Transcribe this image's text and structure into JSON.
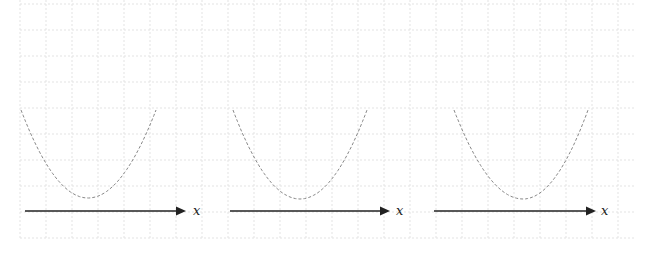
{
  "diagram": {
    "background": "#ffffff",
    "grid": {
      "x_start": 20,
      "x_end": 635,
      "y_start": 0,
      "y_end": 238,
      "spacing": 26,
      "color": "#e3e3e3",
      "dash": "2,2"
    },
    "curve_color": "#888888",
    "axis_color": "#222222",
    "panels": [
      {
        "name": "panel-1",
        "curve": {
          "x_left": 21,
          "x_right": 156,
          "x_min": 88,
          "y_top": 110,
          "y_min": 198
        },
        "axis": {
          "x_start": 25,
          "x_end": 186,
          "y": 211
        },
        "axis_label": "x",
        "label_x": 193
      },
      {
        "name": "panel-2",
        "curve": {
          "x_left": 233,
          "x_right": 367,
          "x_min": 300,
          "y_top": 110,
          "y_min": 199
        },
        "axis": {
          "x_start": 230,
          "x_end": 390,
          "y": 211
        },
        "axis_label": "x",
        "label_x": 396
      },
      {
        "name": "panel-3",
        "curve": {
          "x_left": 454,
          "x_right": 588,
          "x_min": 523,
          "y_top": 110,
          "y_min": 199
        },
        "axis": {
          "x_start": 434,
          "x_end": 596,
          "y": 211
        },
        "axis_label": "x",
        "label_x": 601
      }
    ]
  }
}
